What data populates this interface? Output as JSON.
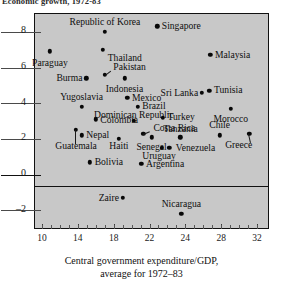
{
  "figure": {
    "top_fragment": "Economic growth, 1972-83",
    "plot_background": "#c8c8c8",
    "frame_color": "#111111",
    "dot_color": "#080808"
  },
  "chart_data": {
    "type": "scatter",
    "title": "",
    "xlabel": "Central government expenditure/GDP,",
    "xlabel_line2": "average for 1972–83",
    "ylabel": "",
    "xlim": [
      8.6,
      33.8
    ],
    "ylim": [
      -3.1,
      9.0
    ],
    "grid": false,
    "legend": "none",
    "xticks": [
      10,
      14,
      18,
      22,
      24,
      28,
      32
    ],
    "xtick_labels": [
      "10",
      "14",
      "18",
      "22",
      "24",
      "28",
      "32"
    ],
    "yticks": [
      8,
      6,
      4,
      2,
      0,
      -2
    ],
    "ytick_labels": [
      "8",
      "6",
      "4",
      "2",
      "0",
      "–2"
    ],
    "zero_axis": 0,
    "points": [
      {
        "name": "Republic of Korea",
        "x": 16.1,
        "y": 8.0,
        "lx": 16.1,
        "ly": 8.55,
        "align": "c"
      },
      {
        "name": "Singapore",
        "x": 21.7,
        "y": 8.3,
        "lx": 22.2,
        "ly": 8.32,
        "align": "l"
      },
      {
        "name": "Paraguay",
        "x": 10.2,
        "y": 6.9,
        "lx": 10.2,
        "ly": 6.25,
        "align": "c"
      },
      {
        "name": "Thailand",
        "x": 15.9,
        "y": 7.0,
        "lx": 16.4,
        "ly": 6.56,
        "align": "l"
      },
      {
        "name": "Malaysia",
        "x": 27.4,
        "y": 6.7,
        "lx": 27.9,
        "ly": 6.7,
        "align": "l"
      },
      {
        "name": "Pakistan",
        "x": 16.1,
        "y": 5.6,
        "lx": 17.0,
        "ly": 6.05,
        "align": "l",
        "leader": true
      },
      {
        "name": "Burma",
        "x": 14.1,
        "y": 5.4,
        "lx": 13.7,
        "ly": 5.4,
        "align": "r"
      },
      {
        "name": "Indonesia",
        "x": 18.2,
        "y": 5.4,
        "lx": 18.2,
        "ly": 4.82,
        "align": "c"
      },
      {
        "name": "Sri Lanka",
        "x": 26.5,
        "y": 4.6,
        "lx": 26.1,
        "ly": 4.6,
        "align": "r"
      },
      {
        "name": "Tunisia",
        "x": 27.3,
        "y": 4.7,
        "lx": 27.8,
        "ly": 4.72,
        "align": "l"
      },
      {
        "name": "Yugoslavia",
        "x": 13.6,
        "y": 3.8,
        "lx": 13.6,
        "ly": 4.34,
        "align": "c"
      },
      {
        "name": "Mexico",
        "x": 18.5,
        "y": 4.3,
        "lx": 19.0,
        "ly": 4.32,
        "align": "l"
      },
      {
        "name": "Brazil",
        "x": 19.6,
        "y": 3.8,
        "lx": 20.1,
        "ly": 3.82,
        "align": "l"
      },
      {
        "name": "Morocco",
        "x": 29.6,
        "y": 3.7,
        "lx": 29.6,
        "ly": 3.12,
        "align": "c"
      },
      {
        "name": "Colombia",
        "x": 15.1,
        "y": 3.1,
        "lx": 15.6,
        "ly": 3.08,
        "align": "l"
      },
      {
        "name": "Dominican Republic",
        "x": 19.2,
        "y": 3.0,
        "lx": 19.2,
        "ly": 3.36,
        "align": "c"
      },
      {
        "name": "Turkey",
        "x": 22.3,
        "y": 3.2,
        "lx": 22.8,
        "ly": 3.22,
        "align": "l"
      },
      {
        "name": "Nepal",
        "x": 13.6,
        "y": 2.2,
        "lx": 14.1,
        "ly": 2.22,
        "align": "l"
      },
      {
        "name": "Guatemala",
        "x": 13.0,
        "y": 2.5,
        "lx": 13.0,
        "ly": 1.6,
        "align": "c",
        "leader": true
      },
      {
        "name": "Costa Rica",
        "x": 20.2,
        "y": 2.3,
        "lx": 21.3,
        "ly": 2.62,
        "align": "l",
        "leader": true
      },
      {
        "name": "Tanzania",
        "x": 24.2,
        "y": 2.1,
        "lx": 24.2,
        "ly": 2.56,
        "align": "c"
      },
      {
        "name": "Chile",
        "x": 28.4,
        "y": 2.2,
        "lx": 28.4,
        "ly": 2.76,
        "align": "c"
      },
      {
        "name": "Greece",
        "x": 31.6,
        "y": 2.3,
        "lx": 31.9,
        "ly": 1.68,
        "align": "r",
        "leader": true
      },
      {
        "name": "Haiti",
        "x": 17.6,
        "y": 2.0,
        "lx": 17.6,
        "ly": 1.58,
        "align": "c"
      },
      {
        "name": "Senegal",
        "x": 21.1,
        "y": 2.1,
        "lx": 21.1,
        "ly": 1.56,
        "align": "c"
      },
      {
        "name": "Venezuela",
        "x": 23.0,
        "y": 1.5,
        "lx": 23.7,
        "ly": 1.52,
        "align": "l"
      },
      {
        "name": "Uruguay",
        "x": 22.2,
        "y": 1.5,
        "lx": 21.9,
        "ly": 1.03,
        "align": "c"
      },
      {
        "name": "Bolivia",
        "x": 14.5,
        "y": 0.7,
        "lx": 15.0,
        "ly": 0.72,
        "align": "l"
      },
      {
        "name": "Argentina",
        "x": 20.0,
        "y": 0.6,
        "lx": 20.5,
        "ly": 0.62,
        "align": "l"
      },
      {
        "name": "Zaire",
        "x": 18.0,
        "y": -1.3,
        "lx": 17.6,
        "ly": -1.3,
        "align": "r"
      },
      {
        "name": "Nicaragua",
        "x": 24.3,
        "y": -2.2,
        "lx": 24.3,
        "ly": -1.62,
        "align": "c"
      }
    ]
  }
}
